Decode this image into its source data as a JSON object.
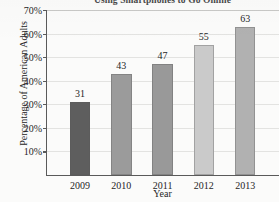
{
  "chart_data": {
    "type": "bar",
    "title": "Using Smartphones to Go Online",
    "xlabel": "Year",
    "ylabel": "Percentage of American Adults",
    "categories": [
      "2009",
      "2010",
      "2011",
      "2012",
      "2013"
    ],
    "values": [
      31,
      43,
      47,
      55,
      63
    ],
    "value_labels": [
      "31",
      "43",
      "47",
      "55",
      "63"
    ],
    "ylim": [
      0,
      70
    ],
    "ytick_values": [
      10,
      20,
      30,
      40,
      50,
      60,
      70
    ],
    "ytick_labels": [
      "10%",
      "20%",
      "30%",
      "40%",
      "50%",
      "60%",
      "70%"
    ],
    "grid": true,
    "legend": false,
    "bar_colors": [
      "#5e5e5e",
      "#9b9b9b",
      "#999999",
      "#cacaca",
      "#b1b1b1"
    ],
    "axis_color": "#5a5a5a",
    "gridline_color": "#e3e3e1",
    "background_color": "#fbfbfa"
  }
}
